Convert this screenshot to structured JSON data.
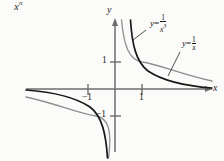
{
  "figure": {
    "header_text": "x",
    "header_exponent": "n",
    "axes": {
      "y_label": "y",
      "x_label": "x",
      "y_tick_pos_label": "1",
      "y_tick_neg_label": "−1",
      "x_tick_pos_label": "1",
      "x_tick_neg_label": "−1",
      "origin_px": {
        "x": 115,
        "y": 89
      },
      "unit_px": 27,
      "x_range": [
        -4.2,
        3.9
      ],
      "y_range": [
        -2.6,
        2.9
      ],
      "grid": false,
      "arrows": [
        "x-positive",
        "y-positive"
      ]
    },
    "curves": [
      {
        "name": "reciprocal-cubed",
        "equation_lhs": "y",
        "equation_eq": "=",
        "numerator": "1",
        "denominator": "x",
        "denominator_exponent": "3",
        "color": "#1a1a1a",
        "stroke_width": 1.6,
        "label_text": "y = 1/x³",
        "label_pos_px": {
          "x": 150,
          "y": 18
        }
      },
      {
        "name": "reciprocal",
        "equation_lhs": "y",
        "equation_eq": "=",
        "numerator": "1",
        "denominator": "x",
        "denominator_exponent": "",
        "color": "#8f8f8f",
        "stroke_width": 1.2,
        "label_text": "y = 1/x",
        "label_pos_px": {
          "x": 182,
          "y": 40
        }
      }
    ],
    "axis_color": "#6e6e6e",
    "background": "#fbfbfa"
  }
}
